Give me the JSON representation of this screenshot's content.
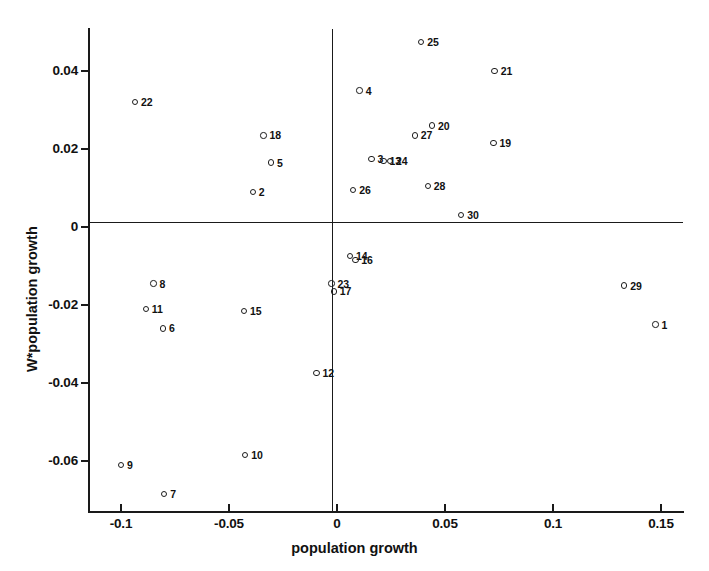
{
  "chart_data": {
    "type": "scatter",
    "title": "",
    "xlabel": "population growth",
    "ylabel": "W*population growth",
    "xlim": [
      -0.108,
      0.1555
    ],
    "ylim": [
      -0.0735,
      0.0525
    ],
    "grid": false,
    "legend": "none",
    "xticks": [
      "-0.1",
      "-0.05",
      "0",
      "0.05",
      "0.1",
      "0.15"
    ],
    "xtick_values": [
      -0.1,
      -0.05,
      0,
      0.05,
      0.1,
      0.15
    ],
    "yticks": [
      "0.04",
      "0.02",
      "0",
      "-0.02",
      "-0.04",
      "-0.06"
    ],
    "ytick_values": [
      0.04,
      0.02,
      0,
      -0.02,
      -0.04,
      -0.06
    ],
    "reference_lines": {
      "horizontal_at": 0,
      "vertical_at": 0
    },
    "marker": "open-circle",
    "points": [
      {
        "label": "1",
        "x": 0.1475,
        "y": -0.025
      },
      {
        "label": "2",
        "x": -0.039,
        "y": 0.009
      },
      {
        "label": "3",
        "x": 0.016,
        "y": 0.0175
      },
      {
        "label": "4",
        "x": 0.0105,
        "y": 0.035
      },
      {
        "label": "5",
        "x": -0.0305,
        "y": 0.0165
      },
      {
        "label": "6",
        "x": -0.0805,
        "y": -0.026
      },
      {
        "label": "7",
        "x": -0.08,
        "y": -0.0685
      },
      {
        "label": "8",
        "x": -0.085,
        "y": -0.0145
      },
      {
        "label": "9",
        "x": -0.1,
        "y": -0.061
      },
      {
        "label": "10",
        "x": -0.0425,
        "y": -0.0585
      },
      {
        "label": "11",
        "x": -0.0885,
        "y": -0.021
      },
      {
        "label": "12",
        "x": -0.0095,
        "y": -0.0375
      },
      {
        "label": "13",
        "x": 0.0215,
        "y": 0.017
      },
      {
        "label": "14",
        "x": 0.006,
        "y": -0.0075
      },
      {
        "label": "15",
        "x": -0.043,
        "y": -0.0215
      },
      {
        "label": "16",
        "x": 0.0085,
        "y": -0.0085
      },
      {
        "label": "17",
        "x": -0.0015,
        "y": -0.0165
      },
      {
        "label": "18",
        "x": -0.034,
        "y": 0.0235
      },
      {
        "label": "19",
        "x": 0.0725,
        "y": 0.0215
      },
      {
        "label": "20",
        "x": 0.044,
        "y": 0.026
      },
      {
        "label": "21",
        "x": 0.073,
        "y": 0.04
      },
      {
        "label": "22",
        "x": -0.0935,
        "y": 0.032
      },
      {
        "label": "23",
        "x": -0.0025,
        "y": -0.0145
      },
      {
        "label": "24",
        "x": 0.0245,
        "y": 0.017
      },
      {
        "label": "25",
        "x": 0.039,
        "y": 0.0475
      },
      {
        "label": "26",
        "x": 0.0075,
        "y": 0.0095
      },
      {
        "label": "27",
        "x": 0.036,
        "y": 0.0235
      },
      {
        "label": "28",
        "x": 0.042,
        "y": 0.0105
      },
      {
        "label": "29",
        "x": 0.133,
        "y": -0.015
      },
      {
        "label": "30",
        "x": 0.0575,
        "y": 0.003
      }
    ]
  }
}
